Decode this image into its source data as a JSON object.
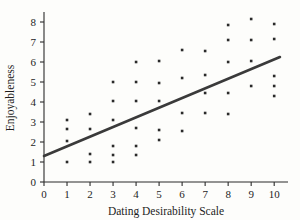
{
  "chart_data": {
    "type": "scatter",
    "title": "",
    "xlabel": "Dating Desirability Scale",
    "ylabel": "Enjoyableness",
    "xlim": [
      0,
      10.6
    ],
    "ylim": [
      0,
      8.4
    ],
    "xticks": [
      0,
      1,
      2,
      3,
      4,
      5,
      6,
      7,
      8,
      9,
      10
    ],
    "yticks": [
      0,
      1,
      2,
      3,
      4,
      5,
      6,
      7,
      8
    ],
    "xtick_labels": [
      "0",
      "1",
      "2",
      "3",
      "4",
      "5",
      "6",
      "7",
      "8",
      "9",
      "10"
    ],
    "ytick_labels": [
      "0",
      "1",
      "2",
      "3",
      "4",
      "5",
      "6",
      "7",
      "8"
    ],
    "grid": false,
    "legend": null,
    "marker": "square",
    "marker_color": "#2a2a2a",
    "points": [
      [
        1,
        1.0
      ],
      [
        1,
        2.05
      ],
      [
        1,
        2.65
      ],
      [
        1,
        3.1
      ],
      [
        2,
        1.0
      ],
      [
        2,
        1.4
      ],
      [
        2,
        2.65
      ],
      [
        2,
        3.4
      ],
      [
        3,
        1.0
      ],
      [
        3,
        1.35
      ],
      [
        3,
        1.8
      ],
      [
        3,
        3.1
      ],
      [
        3,
        4.05
      ],
      [
        3,
        5.0
      ],
      [
        4,
        1.35
      ],
      [
        4,
        1.8
      ],
      [
        4,
        2.7
      ],
      [
        4,
        4.05
      ],
      [
        4,
        5.0
      ],
      [
        4,
        6.0
      ],
      [
        5,
        2.1
      ],
      [
        5,
        2.6
      ],
      [
        5,
        4.05
      ],
      [
        5,
        4.95
      ],
      [
        5,
        6.05
      ],
      [
        6,
        2.55
      ],
      [
        6,
        3.45
      ],
      [
        6,
        5.2
      ],
      [
        6,
        6.6
      ],
      [
        7,
        3.45
      ],
      [
        7,
        4.45
      ],
      [
        7,
        5.35
      ],
      [
        7,
        6.55
      ],
      [
        8,
        3.4
      ],
      [
        8,
        4.45
      ],
      [
        8,
        6.0
      ],
      [
        8,
        7.1
      ],
      [
        8,
        7.85
      ],
      [
        9,
        4.8
      ],
      [
        9,
        6.05
      ],
      [
        9,
        7.1
      ],
      [
        9,
        8.15
      ],
      [
        10,
        4.3
      ],
      [
        10,
        4.8
      ],
      [
        10,
        5.3
      ],
      [
        10,
        7.15
      ],
      [
        10,
        7.9
      ]
    ],
    "regression_line": {
      "x_start": 0,
      "y_start": 1.3,
      "x_end": 10.25,
      "y_end": 6.25,
      "color": "#3a3a3a"
    }
  }
}
